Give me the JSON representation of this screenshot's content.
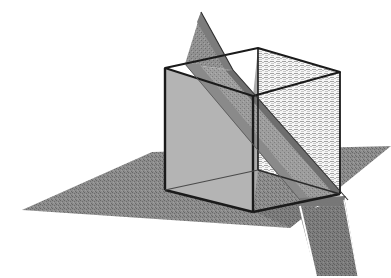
{
  "figure": {
    "title": "Cube intersected by a ground plane and a diagonal cutting plane",
    "caption": "",
    "width": 391,
    "height": 278,
    "background_color": "#ffffff"
  },
  "colors": {
    "background": "#ffffff",
    "ground_plane_fill": "#8a8a8a",
    "ground_plane_dither_dark": "#6e6e6e",
    "ground_plane_shadow": "#7b7b7b",
    "cube_left_face_fill": "#b3b3b3",
    "cube_front_face_fill": "#a8a8a8",
    "cube_right_face_fill": "#f2f2f2",
    "cube_right_face_hatch": "#9a9a9a",
    "cube_top_face_fill": "#ffffff",
    "diagonal_plane_fill": "#9c9c9c",
    "diagonal_plane_dark_band": "#6a6a6a",
    "diagonal_plane_upper_fin": "#8f8f8f",
    "outline": "#1a1a1a",
    "outline_thin": "#3a3a3a"
  },
  "geometry": {
    "cube": {
      "label": "cube",
      "vertices": {
        "top_back_left": [
          165,
          68
        ],
        "top_back_right": [
          258,
          48
        ],
        "top_front_right": [
          340,
          72
        ],
        "top_front_left": [
          253,
          96
        ],
        "bottom_back_left": [
          165,
          190
        ],
        "bottom_back_right": [
          258,
          170
        ],
        "bottom_front_right": [
          340,
          194
        ],
        "bottom_front_left": [
          253,
          212
        ]
      },
      "faces": [
        {
          "name": "left-face",
          "shading": "solid-mid-gray",
          "visible": true
        },
        {
          "name": "front-face",
          "shading": "solid-gray",
          "visible": true
        },
        {
          "name": "right-face",
          "shading": "hatched-transparent",
          "visible": true
        },
        {
          "name": "top-face",
          "shading": "open-wireframe",
          "visible": true
        }
      ]
    },
    "ground_plane": {
      "label": "ground-plane",
      "vertices": [
        [
          22,
          210
        ],
        [
          152,
          152
        ],
        [
          391,
          146
        ],
        [
          290,
          228
        ]
      ],
      "shading": "dithered-gray"
    },
    "diagonal_plane": {
      "label": "diagonal-cutting-plane",
      "description": "A thin planar ribbon slicing diagonally through the cube from upper-left rear to lower-right front, emerging above the top face as a triangular fin and below the ground plane as a narrow band.",
      "fin_apex": [
        201,
        12
      ],
      "entry_point": [
        213,
        70
      ],
      "exit_point": [
        338,
        196
      ],
      "lower_tail_end": [
        358,
        274
      ]
    },
    "shadow": {
      "label": "cube-shadow",
      "vertices": [
        [
          165,
          190
        ],
        [
          253,
          212
        ],
        [
          340,
          194
        ],
        [
          391,
          170
        ]
      ]
    }
  },
  "annotations": {
    "items": []
  }
}
